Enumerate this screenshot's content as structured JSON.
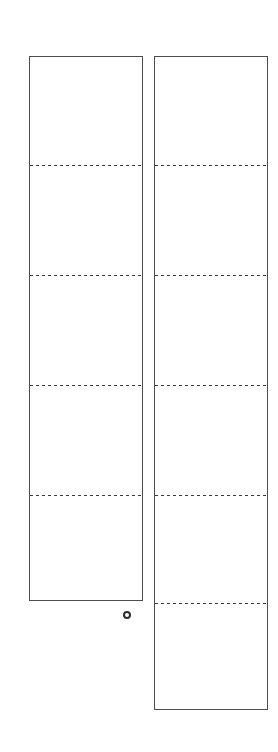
{
  "figure": {
    "background_color": "#ffffff",
    "stroke_color": "#4d4d4d",
    "dash_color": "#3a3a3a",
    "panels": [
      {
        "name": "left-strip",
        "x": 29,
        "y": 56,
        "width": 114,
        "height": 545,
        "segment_count": 5,
        "divider_offsets_y": [
          109,
          219,
          329,
          439
        ]
      },
      {
        "name": "right-strip",
        "x": 154,
        "y": 56,
        "width": 114,
        "height": 654,
        "segment_count": 6,
        "divider_offsets_y": [
          109,
          219,
          329,
          439,
          547
        ]
      }
    ],
    "hole_marker": {
      "center_x": 127,
      "center_y": 615,
      "outer_diameter": 8,
      "stroke_width": 2,
      "color": "#2f2f2f"
    }
  }
}
